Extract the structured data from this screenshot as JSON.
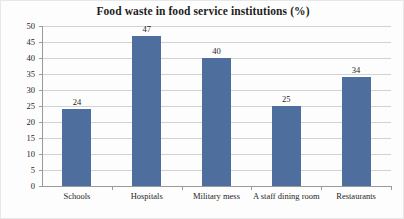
{
  "chart_data": {
    "type": "bar",
    "title": "Food waste in food service institutions (%)",
    "categories": [
      "Schools",
      "Hospitals",
      "Military mess",
      "A staff dining room",
      "Restaurants"
    ],
    "values": [
      24,
      47,
      40,
      25,
      34
    ],
    "xlabel": "",
    "ylabel": "",
    "ylim": [
      0,
      50
    ],
    "yticks": [
      0,
      5,
      10,
      15,
      20,
      25,
      30,
      35,
      40,
      45,
      50
    ],
    "ytick_labels": [
      "0",
      "5",
      "10",
      "15",
      "20",
      "25",
      "30",
      "35",
      "40",
      "45",
      "50"
    ],
    "data_labels": [
      "24",
      "47",
      "40",
      "25",
      "34"
    ],
    "grid": "horizontal",
    "legend": "none",
    "bar_color": "#4e6e9e",
    "grid_color": "#d2d2d2",
    "axis_color": "#9a9a9a",
    "background_color": "#fdfdfd"
  }
}
